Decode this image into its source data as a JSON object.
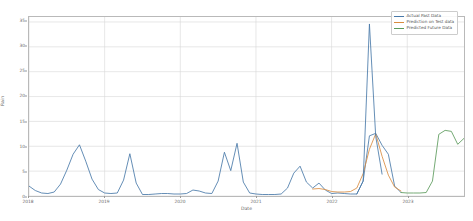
{
  "chart_data": {
    "type": "line",
    "title": "",
    "xlabel": "Date",
    "ylabel": "Rain",
    "ylim": [
      0,
      36
    ],
    "xlim": [
      2018.0,
      2023.75
    ],
    "grid": true,
    "legend_position": "upper right",
    "yticks": [
      0,
      5,
      10,
      15,
      20,
      25,
      30,
      35
    ],
    "ytick_labels": [
      "0",
      "5",
      "10",
      "15",
      "20",
      "25",
      "30",
      "35"
    ],
    "xticks": [
      2018,
      2019,
      2020,
      2021,
      2022,
      2023
    ],
    "xtick_labels": [
      "2018",
      "2019",
      "2020",
      "2021",
      "2022",
      "2023"
    ],
    "series": [
      {
        "name": "Actual Past Data",
        "color": "#4878a8",
        "x": [
          2018.0,
          2018.083,
          2018.167,
          2018.25,
          2018.333,
          2018.417,
          2018.5,
          2018.583,
          2018.667,
          2018.75,
          2018.833,
          2018.917,
          2019.0,
          2019.083,
          2019.167,
          2019.25,
          2019.333,
          2019.417,
          2019.5,
          2019.583,
          2019.667,
          2019.75,
          2019.833,
          2019.917,
          2020.0,
          2020.083,
          2020.167,
          2020.25,
          2020.333,
          2020.417,
          2020.5,
          2020.583,
          2020.667,
          2020.75,
          2020.833,
          2020.917,
          2021.0,
          2021.083,
          2021.167,
          2021.25,
          2021.333,
          2021.417,
          2021.5,
          2021.583,
          2021.667,
          2021.75,
          2021.833,
          2021.917,
          2022.0,
          2022.083,
          2022.167,
          2022.25,
          2022.333,
          2022.417,
          2022.5,
          2022.583,
          2022.667,
          2022.75,
          2022.833,
          2022.917
        ],
        "values": [
          2.0,
          1.1,
          0.6,
          0.5,
          0.8,
          2.4,
          5.2,
          8.4,
          10.3,
          7.0,
          3.4,
          1.3,
          0.6,
          0.5,
          0.6,
          3.2,
          8.5,
          2.6,
          0.3,
          0.3,
          0.4,
          0.5,
          0.5,
          0.4,
          0.4,
          0.5,
          1.2,
          1.0,
          0.6,
          0.5,
          3.0,
          8.8,
          5.1,
          10.6,
          2.8,
          0.6,
          0.4,
          0.3,
          0.3,
          0.3,
          0.4,
          1.6,
          4.6,
          6.0,
          2.8,
          1.6,
          2.6,
          1.2,
          0.5,
          0.6,
          0.5,
          0.4,
          0.4,
          3.0,
          12.1,
          12.6,
          10.2,
          8.4,
          2.0,
          0.7
        ]
      },
      {
        "name": "Prediction on Test data",
        "color": "#d98c3f",
        "x": [
          2021.75,
          2021.833,
          2021.917,
          2022.0,
          2022.083,
          2022.167,
          2022.25,
          2022.333,
          2022.417,
          2022.5,
          2022.583,
          2022.667,
          2022.75,
          2022.833,
          2022.917
        ],
        "values": [
          1.4,
          1.5,
          1.3,
          0.9,
          0.8,
          0.8,
          0.9,
          1.6,
          4.5,
          9.4,
          12.5,
          8.0,
          4.2,
          1.8,
          1.0
        ]
      },
      {
        "name": "Predicted Future Data",
        "color": "#5a9a5a",
        "x": [
          2022.917,
          2023.0,
          2023.083,
          2023.167,
          2023.25,
          2023.333,
          2023.417,
          2023.5,
          2023.583,
          2023.667,
          2023.75
        ],
        "values": [
          0.7,
          0.6,
          0.6,
          0.6,
          0.7,
          3.0,
          12.4,
          13.2,
          13.0,
          10.4,
          11.6
        ]
      },
      {
        "name": "Actual Test Spike",
        "color": "#4878a8",
        "x": [
          2022.333,
          2022.417,
          2022.5,
          2022.583,
          2022.667
        ],
        "values": [
          0.4,
          3.0,
          34.6,
          12.0,
          4.4
        ]
      }
    ]
  },
  "legend": {
    "items": [
      {
        "label": "Actual Past Data",
        "color": "#4878a8"
      },
      {
        "label": "Prediction on Test data",
        "color": "#d98c3f"
      },
      {
        "label": "Predicted Future Data",
        "color": "#5a9a5a"
      }
    ]
  },
  "axes": {
    "xlabel": "Date",
    "ylabel": "Rain"
  }
}
